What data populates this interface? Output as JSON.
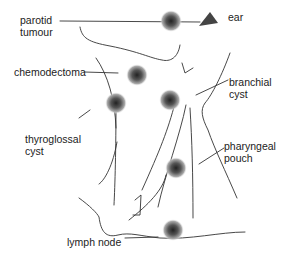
{
  "diagram": {
    "labels": {
      "parotid_tumour": [
        "parotid",
        "tumour"
      ],
      "ear": "ear",
      "chemodectoma": "chemodectoma",
      "branchial_cyst": [
        "branchial",
        "cyst"
      ],
      "thyroglossal_cyst": [
        "thyroglossal",
        "cyst"
      ],
      "pharyngeal_pouch": [
        "pharyngeal",
        "pouch"
      ],
      "lymph_node": "lymph node"
    },
    "lesions": [
      {
        "name": "parotid tumour",
        "x": 171,
        "y": 21
      },
      {
        "name": "chemodectoma",
        "x": 137,
        "y": 75
      },
      {
        "name": "thyroglossal cyst",
        "x": 116,
        "y": 103
      },
      {
        "name": "branchial cyst",
        "x": 170,
        "y": 100
      },
      {
        "name": "pharyngeal pouch",
        "x": 176,
        "y": 168
      },
      {
        "name": "lymph node",
        "x": 173,
        "y": 230
      }
    ],
    "colors": {
      "lesion_core": "#333333",
      "lesion_edge": "#ffffff",
      "line": "#333333",
      "ear_marker": "#444444"
    }
  }
}
